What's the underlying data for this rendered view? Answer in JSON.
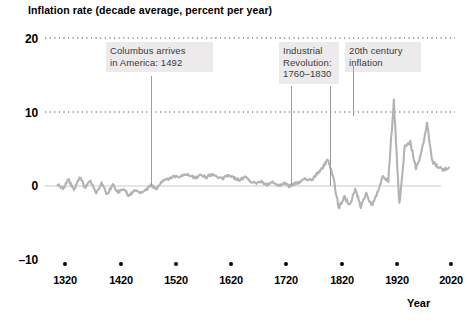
{
  "chart_data": {
    "type": "line",
    "title": "Inflation rate (decade average, percent per year)",
    "xlabel": "Year",
    "ylabel": "",
    "ylim": [
      -10,
      20
    ],
    "xlim": [
      1290,
      2030
    ],
    "yticks": [
      "20",
      "10",
      "0",
      "–10"
    ],
    "ytick_values": [
      20,
      10,
      0,
      -10
    ],
    "xticks": [
      "1320",
      "1420",
      "1520",
      "1620",
      "1720",
      "1820",
      "1920",
      "2020"
    ],
    "xtick_values": [
      1320,
      1420,
      1520,
      1620,
      1720,
      1820,
      1920,
      2020
    ],
    "grid": "horizontal-dotted at 20 and 10; solid zero line at 0",
    "legend": "none",
    "series_color": "#b3b3b3",
    "series": [
      {
        "name": "Inflation rate (decade average)",
        "x": [
          1310,
          1320,
          1330,
          1340,
          1350,
          1360,
          1370,
          1380,
          1390,
          1400,
          1410,
          1420,
          1430,
          1440,
          1450,
          1460,
          1470,
          1480,
          1490,
          1500,
          1510,
          1520,
          1530,
          1540,
          1550,
          1560,
          1570,
          1580,
          1590,
          1600,
          1610,
          1620,
          1630,
          1640,
          1650,
          1660,
          1670,
          1680,
          1690,
          1700,
          1710,
          1720,
          1730,
          1740,
          1750,
          1760,
          1770,
          1780,
          1790,
          1800,
          1810,
          1820,
          1830,
          1840,
          1850,
          1860,
          1870,
          1880,
          1890,
          1900,
          1910,
          1920,
          1930,
          1940,
          1950,
          1960,
          1970,
          1980,
          1990,
          2000,
          2010,
          2020
        ],
        "values": [
          0.3,
          -0.4,
          0.9,
          -0.6,
          1.2,
          -0.2,
          0.7,
          -0.9,
          0.4,
          -1.1,
          0.2,
          -0.8,
          -0.5,
          -1.3,
          -0.6,
          -1.0,
          -0.5,
          0.1,
          -0.4,
          0.6,
          0.9,
          1.3,
          1.1,
          1.6,
          1.4,
          1.1,
          1.5,
          1.2,
          1.6,
          1.3,
          1.0,
          1.4,
          1.1,
          0.8,
          1.2,
          0.6,
          0.3,
          0.6,
          0.2,
          0.5,
          0.1,
          0.4,
          0.0,
          0.3,
          0.6,
          1.0,
          0.8,
          1.6,
          2.4,
          3.6,
          1.2,
          -3.0,
          -1.4,
          -2.6,
          -0.4,
          -2.8,
          -1.1,
          -2.6,
          -0.9,
          1.2,
          0.8,
          11.5,
          -2.6,
          5.4,
          5.9,
          2.3,
          4.5,
          8.6,
          3.3,
          2.6,
          2.2,
          2.5
        ]
      }
    ],
    "annotations": [
      {
        "id": "columbus",
        "text": "Columbus arrives\nin America: 1492",
        "year": 1492
      },
      {
        "id": "industrial-revolution",
        "text": "Industrial\nRevolution:\n1760–1830",
        "year_start": 1760,
        "year_end": 1830
      },
      {
        "id": "twentieth-century-inflation",
        "text": "20th century\ninflation",
        "year": 1920
      }
    ]
  },
  "axes": {
    "y_ticks": [
      {
        "label": "20",
        "top": 32
      },
      {
        "label": "10",
        "top": 106
      },
      {
        "label": "0",
        "top": 179
      },
      {
        "label": "–10",
        "top": 253
      }
    ],
    "x_ticks": [
      {
        "label": "1320",
        "left": 45
      },
      {
        "label": "1420",
        "left": 101
      },
      {
        "label": "1520",
        "left": 156
      },
      {
        "label": "1620",
        "left": 211
      },
      {
        "label": "1720",
        "left": 266
      },
      {
        "label": "1820",
        "left": 322
      },
      {
        "label": "1920",
        "left": 377
      },
      {
        "label": "2020",
        "left": 431
      }
    ],
    "x_axis_title": "Year"
  },
  "annotation_boxes": [
    {
      "name": "columbus-annotation",
      "text": "Columbus arrives\nin America: 1492",
      "left": 106,
      "top": 42,
      "width": 99
    },
    {
      "name": "industrial-revolution-annotation",
      "text": "Industrial\nRevolution:\n1760–1830",
      "left": 279,
      "top": 42,
      "width": 52
    },
    {
      "name": "twentieth-century-annotation",
      "text": "20th century\ninflation",
      "left": 345,
      "top": 42,
      "width": 68
    }
  ],
  "leader_lines": [
    {
      "name": "columbus-leader-line",
      "left": 151,
      "top": 76,
      "height": 110
    },
    {
      "name": "industrial-revolution-leader-line-start",
      "left": 291,
      "top": 86,
      "height": 100
    },
    {
      "name": "industrial-revolution-leader-line-end",
      "left": 330,
      "top": 86,
      "height": 100
    },
    {
      "name": "twentieth-century-leader-line",
      "left": 353,
      "top": 66,
      "height": 50
    }
  ]
}
